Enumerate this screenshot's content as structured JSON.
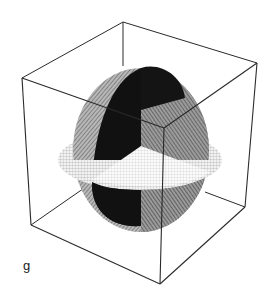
{
  "figure": {
    "panel_label": "g",
    "colors": {
      "background": "#ffffff",
      "cube_edge": "#2a2a2a",
      "dark_disc": "#111111",
      "gray_disc": "#8a8a8a",
      "light_disc": "#d8d8d8"
    },
    "cube": {
      "vertices": {
        "top_back": [
          123,
          22
        ],
        "top_left": [
          22,
          78
        ],
        "top_right": [
          257,
          63
        ],
        "top_front": [
          164,
          128
        ],
        "bottom_left": [
          31,
          225
        ],
        "bottom_front": [
          160,
          284
        ],
        "bottom_right": [
          245,
          207
        ]
      }
    },
    "discs": [
      {
        "name": "horizontal",
        "shade": "light",
        "cx": 140,
        "cy": 160,
        "rx": 82,
        "ry": 30
      },
      {
        "name": "vertical-gray",
        "shade": "gray",
        "cx": 141,
        "cy": 150,
        "rx": 68,
        "ry": 82
      },
      {
        "name": "vertical-dark",
        "shade": "dark",
        "cx": 131,
        "cy": 148,
        "rx": 40,
        "ry": 84
      }
    ]
  }
}
